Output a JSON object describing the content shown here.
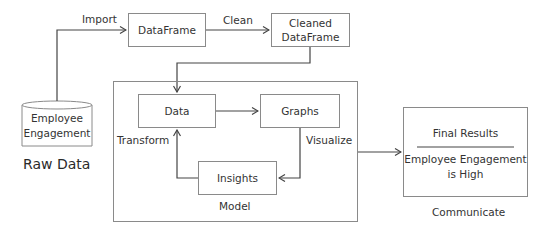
{
  "diagram": {
    "nodes": {
      "raw_source": {
        "label": "Employee Engagement",
        "line1": "Employee",
        "line2": "Engagement",
        "shape": "cylinder"
      },
      "dataframe": {
        "label": "DataFrame"
      },
      "cleaned_dataframe": {
        "label": "Cleaned DataFrame",
        "line1": "Cleaned",
        "line2": "DataFrame"
      },
      "data": {
        "label": "Data"
      },
      "graphs": {
        "label": "Graphs"
      },
      "insights": {
        "label": "Insights"
      },
      "final_results": {
        "title": "Final Results",
        "line1": "Employee Engagement",
        "line2": "is High"
      }
    },
    "labels": {
      "raw_data": "Raw Data",
      "import": "Import",
      "clean": "Clean",
      "transform": "Transform",
      "visualize": "Visualize",
      "model": "Model",
      "communicate": "Communicate"
    },
    "edges": [
      {
        "from": "Employee Engagement",
        "to": "DataFrame",
        "label": "Import"
      },
      {
        "from": "DataFrame",
        "to": "Cleaned DataFrame",
        "label": "Clean"
      },
      {
        "from": "Cleaned DataFrame",
        "to": "Data",
        "label": ""
      },
      {
        "from": "Data",
        "to": "Graphs",
        "label": ""
      },
      {
        "from": "Graphs",
        "to": "Insights",
        "label": "Visualize"
      },
      {
        "from": "Insights",
        "to": "Data",
        "label": "Transform"
      },
      {
        "from": "Model",
        "to": "Final Results",
        "label": "Communicate"
      }
    ],
    "colors": {
      "stroke": "#8a8a8a",
      "arrow": "#444444",
      "text": "#333333"
    }
  }
}
